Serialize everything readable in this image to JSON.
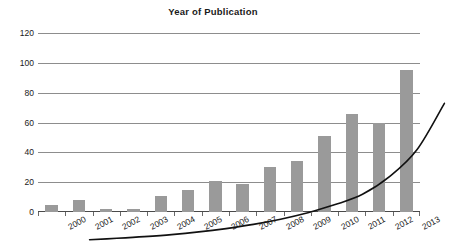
{
  "chart_data": {
    "type": "bar",
    "title": "Year of Publication",
    "xlabel": "",
    "ylabel": "",
    "categories": [
      "2000",
      "2001",
      "2002",
      "2003",
      "2004",
      "2005",
      "2006",
      "2007",
      "2008",
      "2009",
      "2010",
      "2011",
      "2012",
      "2013"
    ],
    "values": [
      5,
      8,
      2,
      2,
      11,
      15,
      21,
      19,
      30,
      34,
      51,
      66,
      60,
      95
    ],
    "ylim": [
      0,
      120
    ],
    "yticks": [
      0,
      20,
      40,
      60,
      80,
      100,
      120
    ],
    "grid": true,
    "legend": "none",
    "series": [
      {
        "name": "Publications",
        "type": "bar",
        "values": [
          5,
          8,
          2,
          2,
          11,
          15,
          21,
          19,
          30,
          34,
          51,
          66,
          60,
          95
        ]
      },
      {
        "name": "Exponential trend",
        "type": "line",
        "values": [
          3.5,
          4.5,
          5.6,
          7.0,
          8.8,
          11.0,
          13.8,
          17.3,
          21.6,
          27.1,
          34.0,
          46.0,
          64.0,
          95.0
        ]
      }
    ],
    "colors": {
      "bar": "#9a9a9a",
      "trend": "#111111",
      "grid": "#8d8d8d",
      "axis": "#4a4a4a",
      "text": "#1a1a1a"
    }
  }
}
